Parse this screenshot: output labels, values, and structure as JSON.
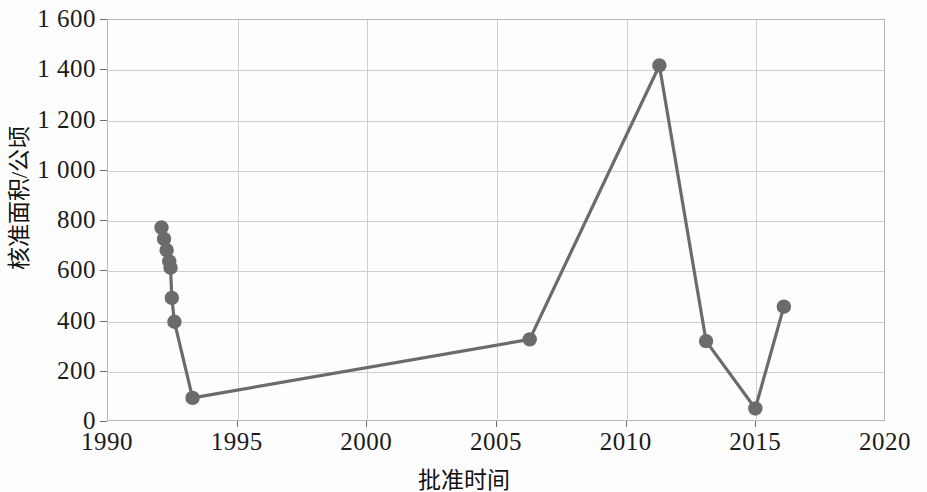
{
  "chart_data": {
    "type": "line",
    "title": "",
    "subtitle": "",
    "xlabel": "批准时间",
    "ylabel": "核准面积/公顷",
    "xlim": [
      1990,
      2020
    ],
    "ylim": [
      0,
      1600
    ],
    "xticks": [
      "1990",
      "1995",
      "2000",
      "2005",
      "2010",
      "2015",
      "2020"
    ],
    "xtick_values": [
      1990,
      1995,
      2000,
      2005,
      2010,
      2015,
      2020
    ],
    "yticks": [
      "0",
      "200",
      "400",
      "600",
      "800",
      "1 000",
      "1 200",
      "1 400",
      "1 600"
    ],
    "ytick_values": [
      0,
      200,
      400,
      600,
      800,
      1000,
      1200,
      1400,
      1600
    ],
    "grid": "horizontal-and-vertical",
    "legend": "none",
    "marker": "filled-circle",
    "series_color": "#6b6b6b",
    "grid_color": "#cfcfcf",
    "axis_color": "#b9b9b9",
    "series": [
      {
        "name": "核准面积",
        "x": [
          1992.1,
          1992.2,
          1992.3,
          1992.4,
          1992.45,
          1992.5,
          1992.6,
          1993.3,
          2006.3,
          2011.3,
          2013.1,
          2015.0,
          2016.1
        ],
        "values": [
          770,
          725,
          680,
          635,
          610,
          490,
          395,
          92,
          325,
          1415,
          318,
          50,
          455
        ]
      }
    ],
    "annotations": []
  }
}
